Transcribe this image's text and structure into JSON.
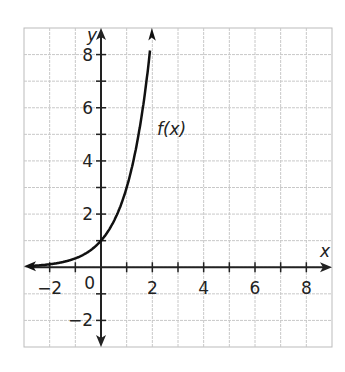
{
  "chart_data": {
    "type": "line",
    "title": "",
    "xlabel": "x",
    "ylabel": "y",
    "xlim": [
      -3,
      9
    ],
    "ylim": [
      -3,
      9
    ],
    "grid": true,
    "x_ticks": [
      -2,
      0,
      2,
      4,
      6,
      8
    ],
    "y_ticks": [
      -2,
      2,
      4,
      6,
      8
    ],
    "origin_label": "0",
    "series": [
      {
        "name": "f(x)",
        "function": "3^x",
        "x": [
          -3,
          -2,
          -1,
          0,
          1,
          1.5,
          2
        ],
        "y": [
          0.04,
          0.11,
          0.33,
          1,
          3,
          5.2,
          9
        ]
      }
    ],
    "annotations": [
      {
        "text": "f(x)",
        "x": 2.1,
        "y": 5.2
      }
    ]
  }
}
